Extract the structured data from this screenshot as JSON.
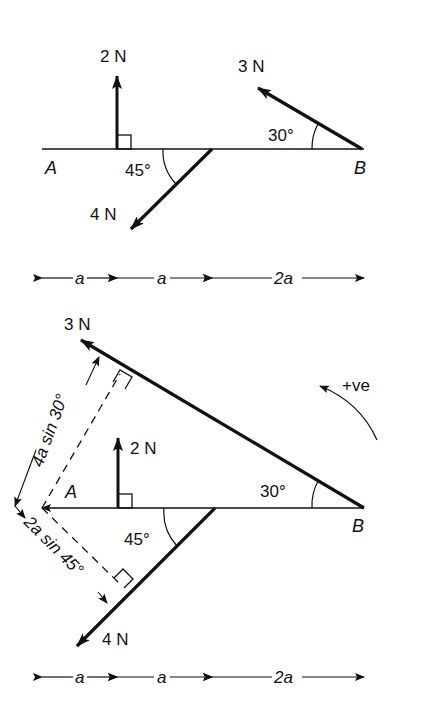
{
  "figure": {
    "top": {
      "points": {
        "A": "A",
        "B": "B"
      },
      "forces": [
        {
          "label": "2 N",
          "direction": "up",
          "note": "perpendicular to AB"
        },
        {
          "label": "3 N",
          "angle_label": "30°",
          "at": "B"
        },
        {
          "label": "4 N",
          "angle_label": "45°"
        }
      ],
      "dimensions": [
        "a",
        "a",
        "2a"
      ]
    },
    "bottom": {
      "points": {
        "A": "A",
        "B": "B"
      },
      "forces": [
        {
          "label": "3 N",
          "angle_label": "30°"
        },
        {
          "label": "2 N"
        },
        {
          "label": "4 N",
          "angle_label": "45°"
        }
      ],
      "moment_arms": {
        "upper": "4a sin 30°",
        "lower": "2a sin 45°"
      },
      "sign_convention": "+ve",
      "dimensions": [
        "a",
        "a",
        "2a"
      ]
    }
  },
  "colors": {
    "ink": "#111111",
    "background": "#ffffff"
  }
}
